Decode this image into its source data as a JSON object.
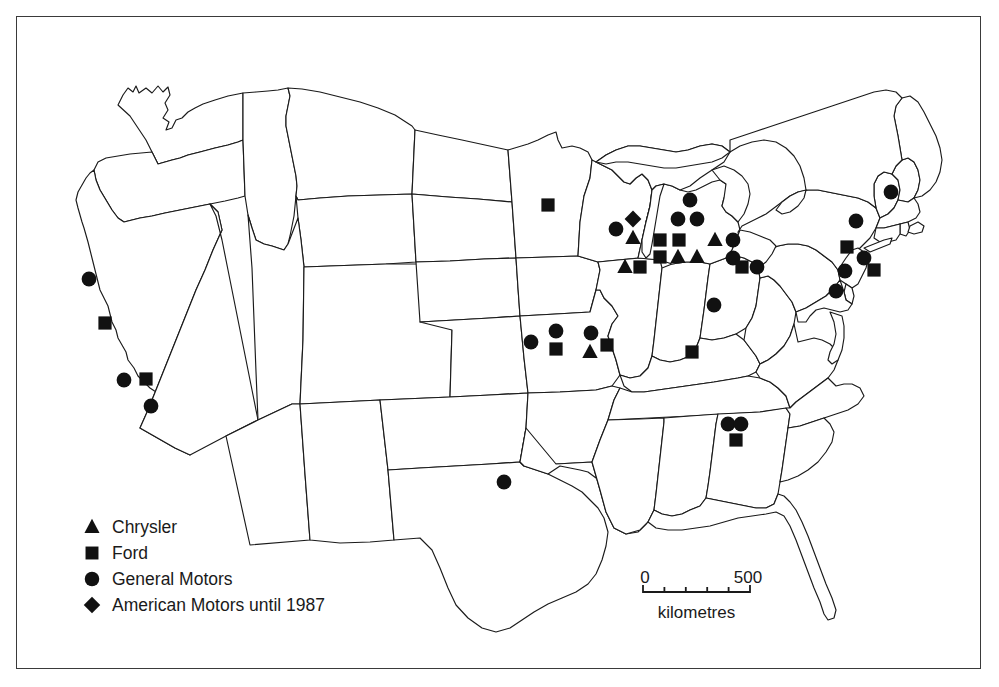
{
  "figure": {
    "background_color": "#ffffff",
    "outline_color": "#1a1a1a",
    "marker_color": "#111111",
    "border_color": "#3a3a3a"
  },
  "legend": {
    "items": [
      {
        "id": "chrysler",
        "symbol": "triangle",
        "label": "Chrysler",
        "x": 92,
        "y": 527
      },
      {
        "id": "ford",
        "symbol": "square",
        "label": "Ford",
        "x": 92,
        "y": 553
      },
      {
        "id": "general-motors",
        "symbol": "circle",
        "label": "General Motors",
        "x": 92,
        "y": 579
      },
      {
        "id": "american-motors",
        "symbol": "diamond",
        "label": "American Motors until 1987",
        "x": 92,
        "y": 605
      }
    ],
    "label_x": 112
  },
  "scale_bar": {
    "start_label": "0",
    "end_label": "500",
    "unit_label": "kilometres",
    "x_start": 643,
    "x_end": 750,
    "y_baseline": 592,
    "tick_count": 6,
    "tick_height": 7,
    "label_y": 583,
    "unit_y": 618
  },
  "chart_data": {
    "type": "scatter",
    "legend_position": "bottom-left",
    "series": [
      {
        "name": "Chrysler",
        "symbol": "triangle",
        "count": 8,
        "points": [
          {
            "label": "Kenosha WI",
            "x": 633,
            "y": 238
          },
          {
            "label": "Belvidere IL",
            "x": 625,
            "y": 267
          },
          {
            "label": "Fenton MO",
            "x": 590,
            "y": 352
          },
          {
            "label": "Sterling Hts MI",
            "x": 715,
            "y": 240
          },
          {
            "label": "Detroit MI A",
            "x": 678,
            "y": 257
          },
          {
            "label": "Detroit MI B",
            "x": 697,
            "y": 257
          },
          {
            "label": "Detroit MI C",
            "x": 716,
            "y": 257
          },
          {
            "label": "Trenton MI",
            "x": 660,
            "y": 257
          }
        ]
      },
      {
        "name": "Ford",
        "symbol": "square",
        "count": 14,
        "points": [
          {
            "label": "San Jose CA",
            "x": 105,
            "y": 323
          },
          {
            "label": "Pico Rivera CA",
            "x": 146,
            "y": 379
          },
          {
            "label": "St Paul MN",
            "x": 548,
            "y": 205
          },
          {
            "label": "Chicago IL",
            "x": 640,
            "y": 267
          },
          {
            "label": "Kansas City MO",
            "x": 556,
            "y": 349
          },
          {
            "label": "Hazelwood MO",
            "x": 607,
            "y": 345
          },
          {
            "label": "Louisville KY",
            "x": 692,
            "y": 352
          },
          {
            "label": "Atlanta GA",
            "x": 736,
            "y": 440
          },
          {
            "label": "Lorain OH",
            "x": 742,
            "y": 267
          },
          {
            "label": "Wayne MI",
            "x": 660,
            "y": 240
          },
          {
            "label": "Dearborn MI",
            "x": 679,
            "y": 240
          },
          {
            "label": "Wixom MI",
            "x": 660,
            "y": 223
          },
          {
            "label": "Edison NJ",
            "x": 847,
            "y": 247
          },
          {
            "label": "Metuchen NJ",
            "x": 874,
            "y": 270
          }
        ]
      },
      {
        "name": "General Motors",
        "symbol": "circle",
        "count": 25,
        "points": [
          {
            "label": "Fremont CA",
            "x": 89,
            "y": 279
          },
          {
            "label": "Van Nuys CA",
            "x": 124,
            "y": 380
          },
          {
            "label": "Southgate CA",
            "x": 151,
            "y": 406
          },
          {
            "label": "Arlington TX",
            "x": 504,
            "y": 482
          },
          {
            "label": "Leeds MO",
            "x": 531,
            "y": 342
          },
          {
            "label": "Fairfax KS",
            "x": 556,
            "y": 331
          },
          {
            "label": "Wentzville MO",
            "x": 591,
            "y": 333
          },
          {
            "label": "Janesville WI",
            "x": 616,
            "y": 229
          },
          {
            "label": "Fort Wayne IN",
            "x": 714,
            "y": 305
          },
          {
            "label": "Doraville GA",
            "x": 728,
            "y": 424
          },
          {
            "label": "Atlanta GA 2",
            "x": 741,
            "y": 424
          },
          {
            "label": "Flint MI",
            "x": 690,
            "y": 200
          },
          {
            "label": "Lansing MI",
            "x": 678,
            "y": 219
          },
          {
            "label": "Pontiac MI",
            "x": 697,
            "y": 219
          },
          {
            "label": "Warren MI",
            "x": 733,
            "y": 240
          },
          {
            "label": "Detroit-Hamtramck",
            "x": 733,
            "y": 258
          },
          {
            "label": "Lordstown OH",
            "x": 757,
            "y": 267
          },
          {
            "label": "Framingham MA",
            "x": 891,
            "y": 192
          },
          {
            "label": "Tarrytown NY",
            "x": 856,
            "y": 221
          },
          {
            "label": "Linden NJ",
            "x": 864,
            "y": 258
          },
          {
            "label": "Baltimore MD",
            "x": 836,
            "y": 281
          },
          {
            "label": "Wilmington DE",
            "x": 845,
            "y": 271
          },
          {
            "label": "Ypsilanti MI",
            "x": 716,
            "y": 226
          },
          {
            "label": "Orion MI",
            "x": 733,
            "y": 224
          },
          {
            "label": "Detroit MI D",
            "x": 733,
            "y": 273
          }
        ]
      },
      {
        "name": "American Motors until 1987",
        "symbol": "diamond",
        "count": 1,
        "points": [
          {
            "label": "Kenosha WI",
            "x": 633,
            "y": 219
          }
        ]
      }
    ]
  },
  "markers": [
    {
      "type": "circle",
      "x": 89,
      "y": 279
    },
    {
      "type": "square",
      "x": 105,
      "y": 323
    },
    {
      "type": "circle",
      "x": 124,
      "y": 380
    },
    {
      "type": "square",
      "x": 146,
      "y": 379
    },
    {
      "type": "circle",
      "x": 151,
      "y": 406
    },
    {
      "type": "circle",
      "x": 504,
      "y": 482
    },
    {
      "type": "square",
      "x": 548,
      "y": 205
    },
    {
      "type": "circle",
      "x": 531,
      "y": 342
    },
    {
      "type": "circle",
      "x": 556,
      "y": 331
    },
    {
      "type": "square",
      "x": 556,
      "y": 349
    },
    {
      "type": "circle",
      "x": 591,
      "y": 333
    },
    {
      "type": "triangle",
      "x": 590,
      "y": 352
    },
    {
      "type": "square",
      "x": 607,
      "y": 345
    },
    {
      "type": "circle",
      "x": 616,
      "y": 229
    },
    {
      "type": "diamond",
      "x": 633,
      "y": 219
    },
    {
      "type": "triangle",
      "x": 633,
      "y": 238
    },
    {
      "type": "triangle",
      "x": 625,
      "y": 267
    },
    {
      "type": "square",
      "x": 640,
      "y": 267
    },
    {
      "type": "circle",
      "x": 690,
      "y": 200
    },
    {
      "type": "circle",
      "x": 678,
      "y": 219
    },
    {
      "type": "circle",
      "x": 697,
      "y": 219
    },
    {
      "type": "square",
      "x": 660,
      "y": 240
    },
    {
      "type": "square",
      "x": 679,
      "y": 240
    },
    {
      "type": "triangle",
      "x": 715,
      "y": 240
    },
    {
      "type": "circle",
      "x": 733,
      "y": 240
    },
    {
      "type": "square",
      "x": 660,
      "y": 257
    },
    {
      "type": "triangle",
      "x": 678,
      "y": 257
    },
    {
      "type": "triangle",
      "x": 697,
      "y": 257
    },
    {
      "type": "circle",
      "x": 733,
      "y": 258
    },
    {
      "type": "square",
      "x": 742,
      "y": 267
    },
    {
      "type": "circle",
      "x": 757,
      "y": 267
    },
    {
      "type": "circle",
      "x": 714,
      "y": 305
    },
    {
      "type": "square",
      "x": 692,
      "y": 352
    },
    {
      "type": "circle",
      "x": 728,
      "y": 424
    },
    {
      "type": "circle",
      "x": 741,
      "y": 424
    },
    {
      "type": "square",
      "x": 736,
      "y": 440
    },
    {
      "type": "circle",
      "x": 891,
      "y": 192
    },
    {
      "type": "circle",
      "x": 856,
      "y": 221
    },
    {
      "type": "square",
      "x": 847,
      "y": 247
    },
    {
      "type": "circle",
      "x": 864,
      "y": 258
    },
    {
      "type": "square",
      "x": 874,
      "y": 270
    },
    {
      "type": "circle",
      "x": 845,
      "y": 271
    },
    {
      "type": "circle",
      "x": 836,
      "y": 291
    }
  ]
}
